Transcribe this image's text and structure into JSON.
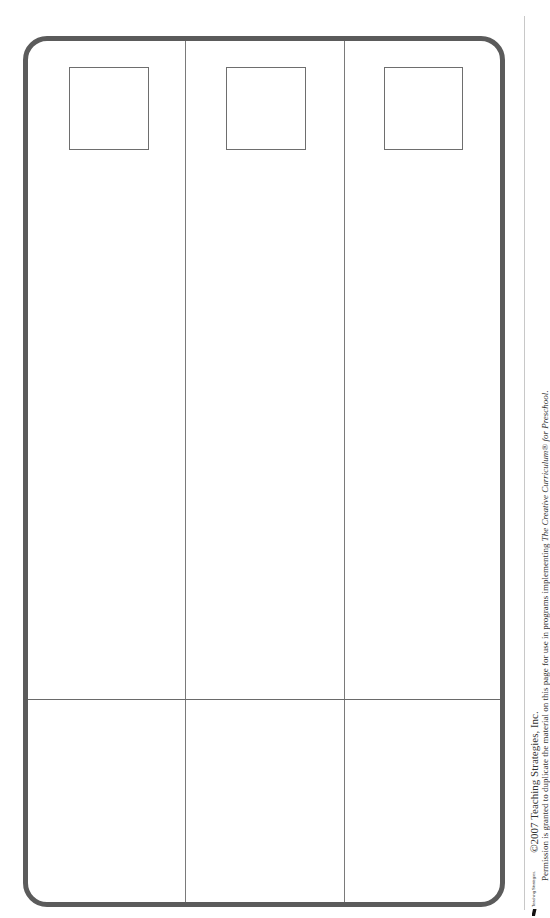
{
  "worksheet": {
    "columns": 3,
    "picture_boxes": 3,
    "rows": [
      "drawing-area",
      "writing-area"
    ]
  },
  "footer": {
    "logo_text": "Teaching Strategies.",
    "copyright": "©2007 Teaching Strategies, Inc.",
    "permission_prefix": "Permission is granted to duplicate the material on this page for use in programs implementing ",
    "permission_title": "The Creative Curriculum® for Preschool",
    "permission_suffix": "."
  },
  "colors": {
    "frame_border": "#5b5b5b",
    "grid_lines": "#7a7a7a",
    "background": "#ffffff"
  }
}
